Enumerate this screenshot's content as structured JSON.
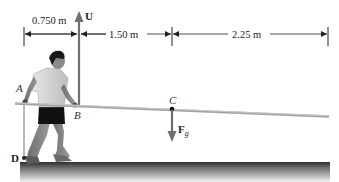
{
  "figure": {
    "dimensions": [
      {
        "id": "dim-ab",
        "label": "0.750 m"
      },
      {
        "id": "dim-bc",
        "label": "1.50 m"
      },
      {
        "id": "dim-c-end",
        "label": "2.25 m"
      }
    ],
    "points": {
      "A": "A",
      "B": "B",
      "C": "C",
      "D": "D"
    },
    "forces": {
      "upward": {
        "symbol": "U"
      },
      "gravity": {
        "symbol": "F",
        "subscript": "g"
      }
    },
    "colors": {
      "pole": "#9a9a9a",
      "arrow": "#6f6f6f",
      "dimension_line": "#333333",
      "ground_top": "#3a3a3a",
      "ground_bottom": "#e6e6e6"
    }
  }
}
